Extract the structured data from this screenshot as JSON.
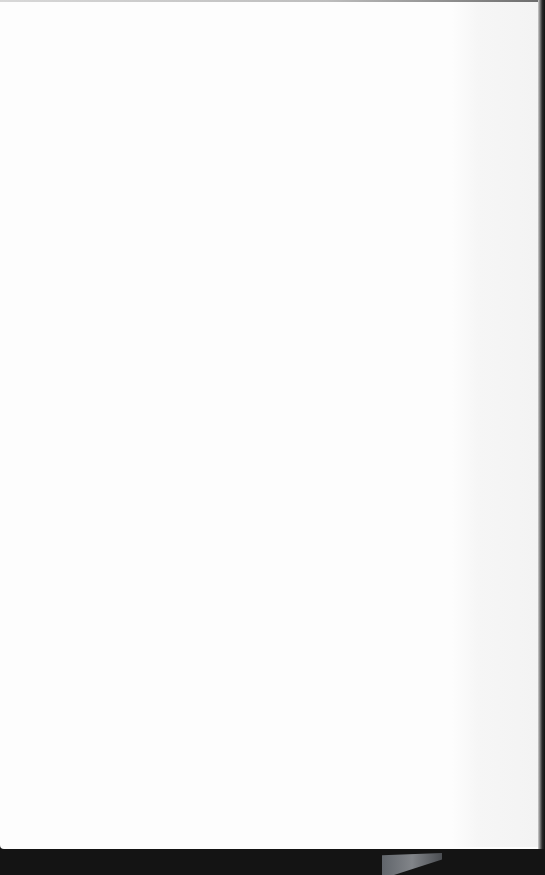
{
  "document": {
    "type": "scanned-page",
    "content": "",
    "is_blank": true,
    "colors": {
      "paper": "#fdfdfd",
      "border": "#1a1a1a"
    }
  }
}
